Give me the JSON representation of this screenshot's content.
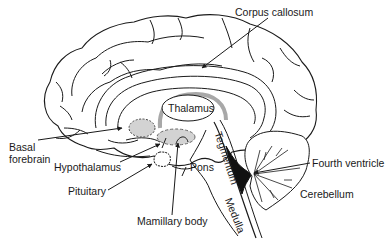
{
  "diagram": {
    "colors": {
      "outline": "#1a1a1a",
      "region_fill": "#d3d3d3",
      "corpus_callosum_arc": "#a8a8a8",
      "ventricle_fill": "#111111",
      "background": "#ffffff"
    },
    "labels": {
      "corpus_callosum": "Corpus callosum",
      "thalamus": "Thalamus",
      "basal_forebrain_line1": "Basal",
      "basal_forebrain_line2": "forebrain",
      "hypothalamus": "Hypothalamus",
      "pituitary": "Pituitary",
      "pons": "Pons",
      "tegmentum": "Tegmentum",
      "medulla": "Medulla",
      "mamillary_body": "Mamillary body",
      "fourth_ventricle": "Fourth ventricle",
      "cerebellum": "Cerebellum"
    }
  }
}
